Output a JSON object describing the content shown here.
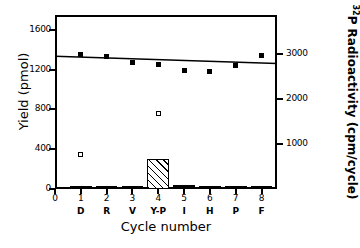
{
  "chart_data": {
    "type": "bar",
    "title": "",
    "xlabel": "Cycle number",
    "ylabel": "Yield (pmol)",
    "y2label": "32P Radioactivity (cpm/cycle)",
    "grid": false,
    "legend": "none",
    "xlim": [
      0,
      8.6
    ],
    "ylim": [
      0,
      1750
    ],
    "y2lim": [
      0,
      3880
    ],
    "categories": [
      1,
      2,
      3,
      4,
      5,
      6,
      7,
      8
    ],
    "residues": [
      "D",
      "R",
      "V",
      "Y-P",
      "I",
      "H",
      "P",
      "F"
    ],
    "x_tick_labels": [
      "0",
      "1",
      "2",
      "3",
      "4",
      "5",
      "6",
      "7",
      "8"
    ],
    "y_tick_labels": [
      "0",
      "400",
      "800",
      "1200",
      "1600"
    ],
    "y_tick_values": [
      0,
      400,
      800,
      1200,
      1600
    ],
    "y2_tick_labels": [
      "1000",
      "2000",
      "3000"
    ],
    "y2_tick_values": [
      1000,
      2000,
      3000
    ],
    "series": [
      {
        "name": "Yield",
        "type": "bar",
        "unit": "pmol",
        "axis": "left",
        "fill": "diagonal-hatch",
        "values": [
          8,
          8,
          6,
          300,
          42,
          22,
          32,
          7
        ]
      },
      {
        "name": "32P Radioactivity",
        "type": "scatter-line",
        "unit": "cpm/cycle",
        "axis": "right",
        "marker": "filled-square",
        "values": [
          3000,
          2950,
          2830,
          2780,
          2650,
          2620,
          2750,
          2980
        ]
      },
      {
        "name": "Background",
        "type": "scatter",
        "axis": "right",
        "marker": "open-square",
        "points": [
          {
            "x": 1,
            "y": 760
          },
          {
            "x": 4,
            "y": 1680
          }
        ]
      }
    ],
    "trend_line": {
      "x_start": 0.0,
      "y_start": 2960,
      "x_end": 8.6,
      "y_end": 2800
    }
  }
}
